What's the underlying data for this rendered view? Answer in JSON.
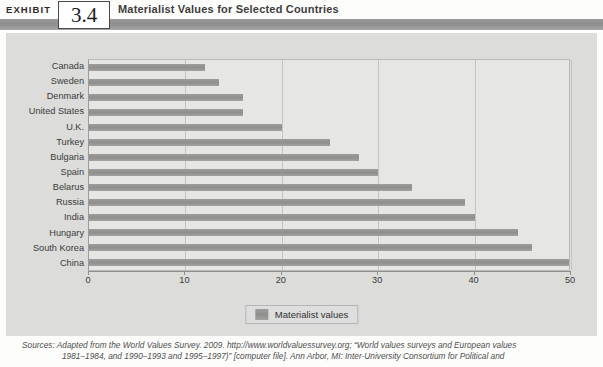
{
  "header": {
    "exhibit_word": "EXHIBIT",
    "exhibit_number": "3.4",
    "title": "Materialist Values for Selected Countries"
  },
  "legend": {
    "label": "Materialist values",
    "swatch_color": "#8f8f8d"
  },
  "sources": {
    "line1": "Sources: Adapted from the World Values Survey. 2009. http://www.worldvaluessurvey.org; “World values surveys and European values",
    "line2": "1981–1984, and 1990–1993 and 1995–1997)” [computer file]. Ann Arbor, MI: Inter-University Consortium for Political and"
  },
  "chart_data": {
    "type": "bar",
    "orientation": "horizontal",
    "title": "Materialist Values for Selected Countries",
    "xlabel": "",
    "ylabel": "",
    "xlim": [
      0,
      50
    ],
    "xticks": [
      0,
      10,
      20,
      30,
      40,
      50
    ],
    "grid": true,
    "legend_position": "bottom-center",
    "categories": [
      "Canada",
      "Sweden",
      "Denmark",
      "United States",
      "U.K.",
      "Turkey",
      "Bulgaria",
      "Spain",
      "Belarus",
      "Russia",
      "India",
      "Hungary",
      "South Korea",
      "China"
    ],
    "series": [
      {
        "name": "Materialist values",
        "color": "#8f8f8d",
        "values": [
          12,
          13.5,
          16,
          16,
          20,
          25,
          28,
          30,
          33.5,
          39,
          40,
          44.5,
          46,
          51
        ]
      }
    ]
  }
}
